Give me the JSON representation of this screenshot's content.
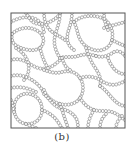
{
  "figure": {
    "caption": "(b)",
    "frame": {
      "x": 11,
      "y": 13,
      "width": 114,
      "height": 115
    },
    "colors": {
      "frame": "#555555",
      "bead_stroke": "#777777",
      "background": "#ffffff"
    },
    "bead_radius": 1.45,
    "bead_spacing": 3.1,
    "chains": [
      "M11,22 C18,18 26,16 33,18 C40,20 43,26 44,32",
      "M12,34 C18,28 28,26 36,30 C44,34 46,42 40,48 C34,52 24,50 17,46 C13,44 11,40 12,34",
      "M26,13 C30,20 33,24 40,24 C48,24 55,20 60,14",
      "M44,13 C44,20 46,26 50,30 C54,34 60,36 65,40",
      "M60,13 C60,22 57,28 55,36 C53,44 56,52 60,58",
      "M72,13 C72,20 70,26 68,32 C66,40 68,46 74,50",
      "M74,22 C80,16 92,14 102,18 C110,22 114,30 112,40 C110,48 102,52 94,50 C86,48 80,42 78,34 C77,30 76,26 74,22",
      "M104,13 C104,20 106,26 108,30",
      "M112,40 C116,42 120,44 125,46",
      "M104,28 C110,26 118,24 125,22",
      "M11,60 C18,58 24,60 30,64 C36,68 42,70 48,68 C54,66 58,62 62,58",
      "M16,48 C22,52 26,56 28,62 C30,70 28,76 24,80",
      "M40,48 C42,56 44,62 48,68",
      "M60,58 C66,56 72,58 78,56 C84,54 90,54 96,56",
      "M96,56 C102,58 108,56 114,52 C118,50 122,52 125,56",
      "M86,48 C88,54 90,60 94,66 C98,72 102,78 100,86",
      "M11,76 C18,74 26,76 32,80 C38,84 42,88 44,94",
      "M11,88 C20,86 28,88 36,92",
      "M44,70 C50,72 56,74 62,72 C70,70 76,72 80,78 C84,84 84,92 80,98 C76,104 68,106 60,104 C52,102 46,96 44,90",
      "M80,78 C86,76 94,76 100,80 C106,84 112,86 118,84 C121,83 123,82 125,81",
      "M100,86 C106,90 110,96 114,100 C118,104 122,106 125,106",
      "M108,58 C110,64 114,70 118,72 C121,74 123,74 125,74",
      "M14,108 C14,98 22,92 30,94 C38,96 42,102 42,110 C42,118 36,124 28,124 C20,124 14,118 14,108",
      "M11,100 C13,104 13,108 14,112",
      "M42,110 C48,112 54,116 58,122 C60,125 61,127 62,128",
      "M46,96 C50,100 54,106 60,108 C66,110 72,112 76,118 C78,122 78,125 78,128",
      "M60,104 C62,110 64,116 66,122 C67,125 68,127 68,128",
      "M80,98 C84,104 88,108 94,110 C100,112 106,110 112,112 C118,114 122,118 125,120",
      "M88,128 C88,122 90,116 94,110",
      "M100,128 C100,122 102,118 106,114",
      "M116,128 C116,124 118,120 122,116",
      "M26,124 C30,126 34,127 36,128",
      "M62,58 C64,64 66,68 70,70"
    ]
  }
}
